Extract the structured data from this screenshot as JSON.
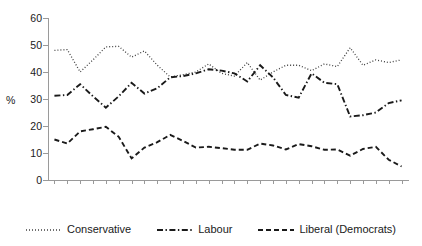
{
  "chart_data": {
    "type": "line",
    "title": "",
    "xlabel": "",
    "ylabel": "%",
    "ylim": [
      0,
      60
    ],
    "yticks": [
      0,
      10,
      20,
      30,
      40,
      50,
      60
    ],
    "grid": false,
    "legend_position": "bottom",
    "categories": [
      "1983",
      "1984",
      "1985",
      "1986",
      "1987",
      "1989",
      "1990",
      "1991",
      "1993",
      "1994",
      "1995",
      "1996",
      "1997",
      "1998",
      "1999",
      "2000",
      "2001",
      "2002",
      "2003",
      "2004",
      "2005",
      "2006",
      "2007",
      "2008",
      "2009",
      "2010",
      "2011",
      "2012"
    ],
    "series": [
      {
        "name": "Conservative",
        "style": "dotted",
        "color": "#404040",
        "values": [
          48.0,
          48.3,
          40.0,
          44.5,
          49.3,
          49.5,
          45.5,
          47.8,
          42.5,
          38.2,
          39.0,
          40.0,
          43.0,
          39.5,
          38.5,
          43.5,
          37.0,
          40.0,
          42.5,
          42.5,
          40.5,
          43.0,
          42.0,
          49.0,
          42.5,
          44.5,
          43.5,
          44.5
        ]
      },
      {
        "name": "Labour",
        "style": "dash-dot",
        "color": "#1a1a1a",
        "values": [
          31.2,
          31.5,
          35.5,
          31.0,
          26.8,
          31.0,
          36.0,
          32.0,
          34.0,
          38.0,
          38.5,
          39.5,
          41.0,
          40.5,
          39.5,
          36.5,
          42.5,
          38.0,
          31.5,
          30.5,
          39.5,
          36.0,
          35.5,
          23.5,
          24.0,
          25.0,
          28.5,
          29.5
        ]
      },
      {
        "name": "Liberal (Democrats)",
        "style": "dashed",
        "color": "#1a1a1a",
        "values": [
          15.0,
          13.5,
          18.0,
          18.8,
          19.7,
          16.0,
          8.0,
          12.0,
          14.0,
          16.7,
          14.5,
          12.0,
          12.3,
          11.8,
          11.2,
          11.2,
          13.5,
          12.8,
          11.3,
          13.3,
          12.5,
          11.2,
          11.3,
          9.0,
          11.5,
          12.3,
          7.5,
          5.0
        ]
      }
    ]
  },
  "legend": {
    "items": [
      {
        "label": "Conservative"
      },
      {
        "label": "Labour"
      },
      {
        "label": "Liberal (Democrats)"
      }
    ]
  },
  "axis": {
    "y_title": "%"
  }
}
